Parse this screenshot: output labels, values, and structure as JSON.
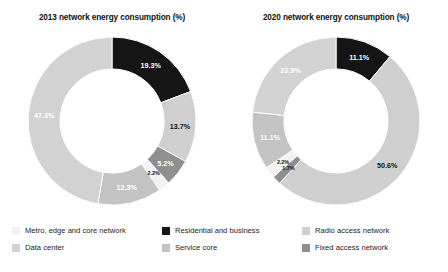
{
  "figure": {
    "background": "#ffffff"
  },
  "palette": {
    "metro_edge_core": "#f2f2f2",
    "data_center": "#d2d2d2",
    "residential_business": "#151515",
    "service_core": "#c3c3c3",
    "radio_access": "#cfcfcf",
    "fixed_access": "#8f8f8f",
    "label_dark": "#111111",
    "label_light": "#ffffff"
  },
  "charts": [
    {
      "id": "chart-2013",
      "title": "2013 network energy consumption (%)"
    },
    {
      "id": "chart-2020",
      "title": "2020 network energy consumption (%)"
    }
  ],
  "legend": {
    "items": [
      {
        "label": "Metro, edge and core network",
        "color": "#f2f2f2",
        "swatch_name": "legend-swatch-metro-edge-core"
      },
      {
        "label": "Residential and business",
        "color": "#151515",
        "swatch_name": "legend-swatch-residential-business"
      },
      {
        "label": "Radio access network",
        "color": "#cfcfcf",
        "swatch_name": "legend-swatch-radio-access"
      },
      {
        "label": "Data center",
        "color": "#d2d2d2",
        "swatch_name": "legend-swatch-data-center"
      },
      {
        "label": "Service core",
        "color": "#c3c3c3",
        "swatch_name": "legend-swatch-service-core"
      },
      {
        "label": "Fixed access network",
        "color": "#8f8f8f",
        "swatch_name": "legend-swatch-fixed-access"
      }
    ]
  },
  "chart_data": [
    {
      "type": "pie",
      "variant": "donut",
      "id": "chart-2013",
      "title": "2013 network energy consumption (%)",
      "xlabel": "",
      "ylabel": "",
      "units": "%",
      "start_angle_deg": 0,
      "direction": "clockwise",
      "inner_radius_ratio": 0.62,
      "legend_position": "bottom",
      "grid": false,
      "total": 100.0,
      "categories": [
        "Residential and business",
        "Radio access network",
        "Fixed access network",
        "Metro, edge and core network",
        "Service core",
        "Data center"
      ],
      "values": [
        19.3,
        13.7,
        5.2,
        2.2,
        12.3,
        47.3
      ],
      "labels": [
        "19.3%",
        "13.7%",
        "5.2%",
        "2.2%",
        "12.3%",
        "47.3%"
      ],
      "colors": [
        "#151515",
        "#cfcfcf",
        "#8f8f8f",
        "#f2f2f2",
        "#c3c3c3",
        "#d2d2d2"
      ],
      "label_colors": [
        "#ffffff",
        "#111111",
        "#ffffff",
        "#111111",
        "#ffffff",
        "#ffffff"
      ]
    },
    {
      "type": "pie",
      "variant": "donut",
      "id": "chart-2020",
      "title": "2020 network energy consumption (%)",
      "xlabel": "",
      "ylabel": "",
      "units": "%",
      "start_angle_deg": 0,
      "direction": "clockwise",
      "inner_radius_ratio": 0.62,
      "legend_position": "bottom",
      "grid": false,
      "total": 100.0,
      "categories": [
        "Residential and business",
        "Radio access network",
        "Fixed access network",
        "Metro, edge and core network",
        "Service core",
        "Data center"
      ],
      "values": [
        11.1,
        50.6,
        1.7,
        2.2,
        11.1,
        23.3
      ],
      "labels": [
        "11.1%",
        "50.6%",
        "1.7%",
        "2.2%",
        "11.1%",
        "23.3%"
      ],
      "colors": [
        "#151515",
        "#cfcfcf",
        "#8f8f8f",
        "#f2f2f2",
        "#c3c3c3",
        "#d2d2d2"
      ],
      "label_colors": [
        "#ffffff",
        "#111111",
        "#111111",
        "#111111",
        "#ffffff",
        "#ffffff"
      ]
    }
  ]
}
